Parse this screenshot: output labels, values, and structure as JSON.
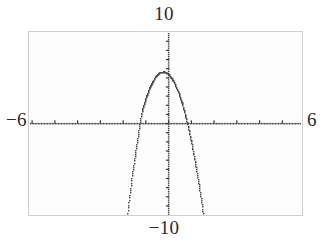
{
  "labels": {
    "top": "10",
    "bottom": "−10",
    "left": "−6",
    "right": "6"
  },
  "colors": {
    "ink": "#2b2b2b",
    "curve": "#4a4a4a",
    "axis": "#3a3a3a",
    "frame": "#cfcfcf",
    "background": "#fdfdfd"
  },
  "chart_data": {
    "type": "line",
    "title": "",
    "xlabel": "",
    "ylabel": "",
    "xlim": [
      -6,
      6
    ],
    "ylim": [
      -10,
      10
    ],
    "grid": false,
    "legend": "none",
    "x_tick_labels": [
      "-6",
      "6"
    ],
    "y_tick_labels": [
      "10",
      "-10"
    ],
    "x_tick_step": 1,
    "y_tick_step": 1,
    "render_style": "dotted-pixel",
    "annotations": {
      "vertex": [
        -0.25,
        5.7
      ],
      "roots": [
        -1.5,
        1.0
      ],
      "plateau_note": "flat pixelated vertex near y = 5.7"
    },
    "series": [
      {
        "name": "parabola",
        "equation": "y = -5x^2 - 2.5x + 5.4",
        "x": [
          -4.35,
          -4.2,
          -4.0,
          -3.8,
          -3.6,
          -3.4,
          -3.2,
          -3.0,
          -2.8,
          -2.6,
          -2.4,
          -2.2,
          -2.0,
          -1.8,
          -1.6,
          -1.4,
          -1.2,
          -1.0,
          -0.8,
          -0.6,
          -0.4,
          -0.2,
          0.0,
          0.2,
          0.4,
          0.6,
          0.8,
          1.0,
          1.2,
          1.4,
          1.6,
          1.8,
          2.0,
          2.2,
          2.4,
          2.6,
          2.8,
          3.0,
          3.2,
          3.4,
          3.42
        ],
        "y": [
          -78.4,
          -72.3,
          -64.6,
          -57.3,
          -50.4,
          -43.9,
          -37.8,
          -42.1,
          -38.4,
          -33.8,
          -27.6,
          -21.0,
          -14.6,
          -9.4,
          -5.4,
          -2.0,
          1.2,
          2.9,
          4.2,
          5.1,
          5.6,
          5.7,
          5.4,
          4.7,
          3.6,
          2.1,
          0.2,
          -2.1,
          -4.8,
          -7.9,
          -11.4,
          -15.3,
          -19.6,
          -24.3,
          -29.4,
          -34.9,
          -40.8,
          -47.1,
          -53.8,
          -60.9,
          -61.6
        ]
      }
    ]
  }
}
